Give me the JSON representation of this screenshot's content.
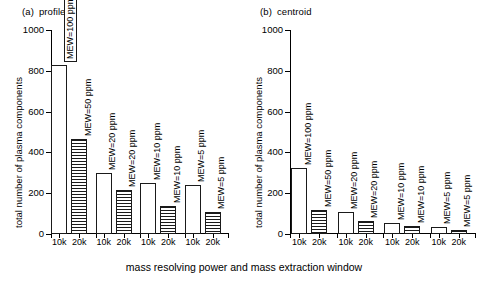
{
  "figure": {
    "xaxis_caption": "mass resolving power and mass extraction window",
    "ylabel": "total number of plasma components"
  },
  "panels": [
    {
      "tag": "(a)",
      "title": "profile",
      "ylabel": "total number of plasma components"
    },
    {
      "tag": "(b)",
      "title": "centroid",
      "ylabel": "total number of plasma components"
    }
  ],
  "axis": {
    "yticks": [
      0,
      200,
      400,
      600,
      800,
      1000
    ],
    "ytick_labels": [
      "0",
      "200",
      "400",
      "600",
      "800",
      "1000"
    ],
    "ymin": 0,
    "ymax": 1000,
    "xtick_labels": [
      "10k",
      "20k",
      "10k",
      "20k",
      "10k",
      "20k",
      "10k",
      "20k"
    ]
  },
  "bar_labels": [
    "MEW=100 ppm",
    "MEW=50 ppm",
    "MEW=20 ppm",
    "MEW=20 ppm",
    "MEW=10 ppm",
    "MEW=10 ppm",
    "MEW=5 ppm",
    "MEW=5 ppm"
  ],
  "chart_data": [
    {
      "type": "bar",
      "title": "(a) profile",
      "xlabel": "mass resolving power and mass extraction window",
      "ylabel": "total number of plasma components",
      "ylim": [
        0,
        1000
      ],
      "yticks": [
        0,
        200,
        400,
        600,
        800,
        1000
      ],
      "grid": false,
      "legend": "none",
      "categories": [
        "10k",
        "20k",
        "10k",
        "20k",
        "10k",
        "20k",
        "10k",
        "20k"
      ],
      "groups": [
        "MEW=100/50 ppm",
        "MEW=20 ppm",
        "MEW=10 ppm",
        "MEW=5 ppm"
      ],
      "annotations": [
        "MEW=100 ppm",
        "MEW=50 ppm",
        "MEW=20 ppm",
        "MEW=20 ppm",
        "MEW=10 ppm",
        "MEW=10 ppm",
        "MEW=5 ppm",
        "MEW=5 ppm"
      ],
      "series": [
        {
          "name": "10k (open)",
          "values": [
            830,
            300,
            250,
            240
          ]
        },
        {
          "name": "20k (hatched)",
          "values": [
            465,
            215,
            135,
            110
          ]
        }
      ],
      "values": [
        830,
        465,
        300,
        215,
        250,
        135,
        240,
        110
      ]
    },
    {
      "type": "bar",
      "title": "(b) centroid",
      "xlabel": "mass resolving power and mass extraction window",
      "ylabel": "total number of plasma components",
      "ylim": [
        0,
        1000
      ],
      "yticks": [
        0,
        200,
        400,
        600,
        800,
        1000
      ],
      "grid": false,
      "legend": "none",
      "categories": [
        "10k",
        "20k",
        "10k",
        "20k",
        "10k",
        "20k",
        "10k",
        "20k"
      ],
      "groups": [
        "MEW=100/50 ppm",
        "MEW=20 ppm",
        "MEW=10 ppm",
        "MEW=5 ppm"
      ],
      "annotations": [
        "MEW=100 ppm",
        "MEW=50 ppm",
        "MEW=20 ppm",
        "MEW=20 ppm",
        "MEW=10 ppm",
        "MEW=10 ppm",
        "MEW=5 ppm",
        "MEW=5 ppm"
      ],
      "series": [
        {
          "name": "10k (open)",
          "values": [
            325,
            110,
            52,
            32
          ]
        },
        {
          "name": "20k (hatched)",
          "values": [
            118,
            62,
            40,
            22
          ]
        }
      ],
      "values": [
        325,
        118,
        110,
        62,
        52,
        40,
        32,
        22
      ]
    }
  ],
  "colors": {
    "ink": "#1a1a1a",
    "background": "#ffffff"
  }
}
